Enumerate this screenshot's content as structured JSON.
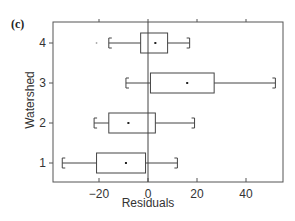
{
  "panel_label": "(c)",
  "chart_data": {
    "type": "box",
    "title": "",
    "xlabel": "Residuals",
    "ylabel": "Watershed",
    "xlim": [
      -38,
      55
    ],
    "x_ticks": [
      -20,
      0,
      20,
      40
    ],
    "x_tick_labels": [
      "−20",
      "0",
      "20",
      "40"
    ],
    "y_ticks": [
      1,
      2,
      3,
      4
    ],
    "y_tick_labels": [
      "1",
      "2",
      "3",
      "4"
    ],
    "reference_line_x": 0,
    "grid": false,
    "orientation": "horizontal",
    "series": [
      {
        "name": "1",
        "whisker_low": -35,
        "q1": -21,
        "mean": -9,
        "q3": -1,
        "whisker_high": 12,
        "outliers": []
      },
      {
        "name": "2",
        "whisker_low": -22,
        "q1": -16,
        "mean": -8,
        "q3": 3,
        "whisker_high": 19,
        "outliers": []
      },
      {
        "name": "3",
        "whisker_low": -9,
        "q1": 1,
        "mean": 16,
        "q3": 27,
        "whisker_high": 52,
        "outliers": []
      },
      {
        "name": "4",
        "whisker_low": -16,
        "q1": -3,
        "mean": 3,
        "q3": 8,
        "whisker_high": 17,
        "outliers": [
          -21
        ]
      }
    ]
  },
  "colors": {
    "axis": "#555555",
    "box": "#444444",
    "text": "#333333"
  }
}
